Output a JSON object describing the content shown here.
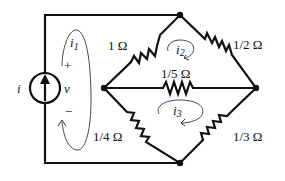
{
  "diagram": {
    "type": "circuit",
    "source": {
      "kind": "current-source",
      "current_label": "i",
      "voltage_label": "v",
      "plus": "+",
      "minus": "−"
    },
    "resistors": [
      {
        "id": "R1",
        "label": "1 Ω",
        "between": "left-node / top-node"
      },
      {
        "id": "R2",
        "label": "1/2 Ω",
        "between": "top-node / right-node"
      },
      {
        "id": "R3",
        "label": "1/5 Ω",
        "between": "left-node / right-node"
      },
      {
        "id": "R4",
        "label": "1/4 Ω",
        "between": "left-node / bottom-node"
      },
      {
        "id": "R5",
        "label": "1/3 Ω",
        "between": "bottom-node / right-node"
      }
    ],
    "mesh_currents": [
      {
        "id": "i1",
        "label": "i",
        "sub": "1"
      },
      {
        "id": "i2",
        "label": "i",
        "sub": "2"
      },
      {
        "id": "i3",
        "label": "i",
        "sub": "3"
      }
    ],
    "colors": {
      "wire": "#111111",
      "background": "#ffffff"
    }
  }
}
